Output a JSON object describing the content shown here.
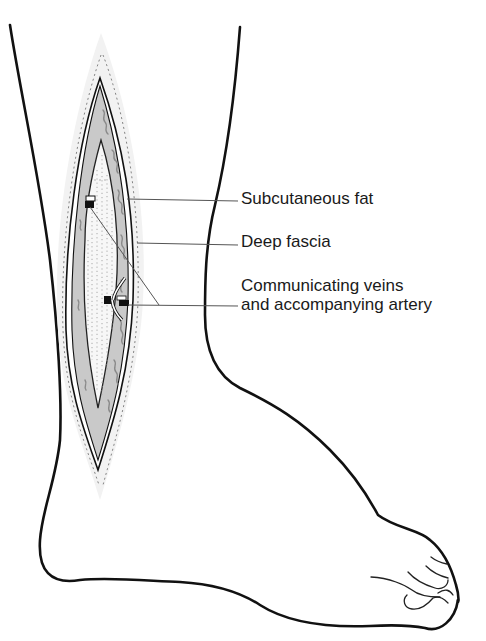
{
  "figure": {
    "labels": [
      {
        "id": "subcutaneous-fat",
        "text": "Subcutaneous fat"
      },
      {
        "id": "deep-fascia",
        "text": "Deep fascia"
      },
      {
        "id": "communicating-veins",
        "line1": "Communicating veins",
        "line2": "and accompanying artery"
      }
    ]
  },
  "colors": {
    "outline": "#111111",
    "fat_fill": "#c8c8c8",
    "fat_texture": "#8a8a8a",
    "fascia_fill": "#f4f4f4",
    "leader_line": "#555555",
    "label_text": "#1a1a1a"
  }
}
